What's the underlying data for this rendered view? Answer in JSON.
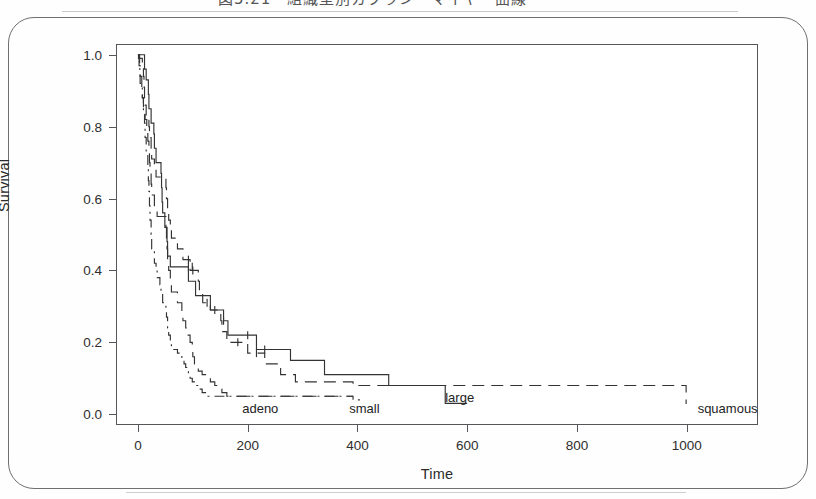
{
  "figure": {
    "caption": "図5.21　組織型別カプラン・マイヤー曲線",
    "border_color": "#6f6f6f",
    "background": "#ffffff"
  },
  "chart_data": {
    "type": "line",
    "title": "",
    "xlabel": "Time",
    "ylabel": "Survival",
    "xlim": [
      -40,
      1130
    ],
    "ylim": [
      -0.03,
      1.03
    ],
    "grid": false,
    "legend_position": "inline-annotations",
    "xticks": [
      0,
      200,
      400,
      600,
      800,
      1000
    ],
    "xtick_labels": [
      "0",
      "200",
      "400",
      "600",
      "800",
      "1000"
    ],
    "yticks": [
      0.0,
      0.2,
      0.4,
      0.6,
      0.8,
      1.0
    ],
    "ytick_labels": [
      "0.0",
      "0.2",
      "0.4",
      "0.6",
      "0.8",
      "1.0"
    ],
    "annotations": [
      {
        "text": "adeno",
        "x": 190,
        "y": 0.02
      },
      {
        "text": "small",
        "x": 385,
        "y": 0.02
      },
      {
        "text": "large",
        "x": 560,
        "y": 0.05
      },
      {
        "text": "squamous",
        "x": 1020,
        "y": 0.02
      }
    ],
    "series": [
      {
        "name": "squamous",
        "label": "squamous",
        "dash": "12,7",
        "color": "#333333",
        "points": [
          [
            0,
            1.0
          ],
          [
            1,
            0.99
          ],
          [
            8,
            0.97
          ],
          [
            10,
            0.94
          ],
          [
            11,
            0.91
          ],
          [
            12,
            0.88
          ],
          [
            13,
            0.86
          ],
          [
            15,
            0.83
          ],
          [
            20,
            0.8
          ],
          [
            21,
            0.77
          ],
          [
            24,
            0.74
          ],
          [
            25,
            0.71
          ],
          [
            30,
            0.69
          ],
          [
            33,
            0.66
          ],
          [
            51,
            0.63
          ],
          [
            52,
            0.6
          ],
          [
            54,
            0.57
          ],
          [
            56,
            0.54
          ],
          [
            59,
            0.51
          ],
          [
            61,
            0.49
          ],
          [
            72,
            0.46
          ],
          [
            82,
            0.43
          ],
          [
            92,
            0.43
          ],
          [
            95,
            0.4
          ],
          [
            100,
            0.4
          ],
          [
            110,
            0.37
          ],
          [
            112,
            0.34
          ],
          [
            117,
            0.34
          ],
          [
            118,
            0.31
          ],
          [
            126,
            0.31
          ],
          [
            132,
            0.29
          ],
          [
            140,
            0.29
          ],
          [
            151,
            0.26
          ],
          [
            153,
            0.23
          ],
          [
            162,
            0.2
          ],
          [
            182,
            0.2
          ],
          [
            200,
            0.17
          ],
          [
            216,
            0.17
          ],
          [
            231,
            0.14
          ],
          [
            250,
            0.14
          ],
          [
            260,
            0.11
          ],
          [
            278,
            0.11
          ],
          [
            283,
            0.11
          ],
          [
            287,
            0.09
          ],
          [
            314,
            0.09
          ],
          [
            340,
            0.09
          ],
          [
            384,
            0.09
          ],
          [
            389,
            0.09
          ],
          [
            392,
            0.08
          ],
          [
            553,
            0.08
          ],
          [
            991,
            0.08
          ],
          [
            999,
            0.03
          ],
          [
            1000,
            0.03
          ]
        ]
      },
      {
        "name": "large",
        "label": "large",
        "dash": "none",
        "color": "#333333",
        "points": [
          [
            0,
            1.0
          ],
          [
            12,
            0.96
          ],
          [
            15,
            0.93
          ],
          [
            19,
            0.89
          ],
          [
            20,
            0.85
          ],
          [
            24,
            0.81
          ],
          [
            29,
            0.78
          ],
          [
            30,
            0.74
          ],
          [
            33,
            0.7
          ],
          [
            42,
            0.67
          ],
          [
            43,
            0.63
          ],
          [
            44,
            0.59
          ],
          [
            45,
            0.56
          ],
          [
            49,
            0.52
          ],
          [
            53,
            0.48
          ],
          [
            54,
            0.44
          ],
          [
            57,
            0.44
          ],
          [
            59,
            0.41
          ],
          [
            63,
            0.41
          ],
          [
            80,
            0.41
          ],
          [
            84,
            0.41
          ],
          [
            87,
            0.41
          ],
          [
            92,
            0.37
          ],
          [
            99,
            0.37
          ],
          [
            103,
            0.37
          ],
          [
            105,
            0.33
          ],
          [
            111,
            0.33
          ],
          [
            112,
            0.33
          ],
          [
            116,
            0.33
          ],
          [
            132,
            0.29
          ],
          [
            133,
            0.29
          ],
          [
            140,
            0.29
          ],
          [
            156,
            0.26
          ],
          [
            162,
            0.26
          ],
          [
            164,
            0.22
          ],
          [
            177,
            0.22
          ],
          [
            186,
            0.22
          ],
          [
            200,
            0.22
          ],
          [
            216,
            0.18
          ],
          [
            231,
            0.18
          ],
          [
            250,
            0.18
          ],
          [
            260,
            0.18
          ],
          [
            278,
            0.15
          ],
          [
            283,
            0.15
          ],
          [
            287,
            0.15
          ],
          [
            314,
            0.15
          ],
          [
            340,
            0.11
          ],
          [
            378,
            0.11
          ],
          [
            384,
            0.11
          ],
          [
            392,
            0.11
          ],
          [
            411,
            0.11
          ],
          [
            457,
            0.08
          ],
          [
            467,
            0.08
          ],
          [
            553,
            0.08
          ],
          [
            560,
            0.03
          ],
          [
            600,
            0.03
          ]
        ]
      },
      {
        "name": "small",
        "label": "small",
        "dash": "14,8",
        "color": "#333333",
        "points": [
          [
            0,
            1.0
          ],
          [
            2,
            0.97
          ],
          [
            4,
            0.94
          ],
          [
            7,
            0.91
          ],
          [
            8,
            0.88
          ],
          [
            10,
            0.85
          ],
          [
            13,
            0.82
          ],
          [
            16,
            0.79
          ],
          [
            18,
            0.76
          ],
          [
            20,
            0.73
          ],
          [
            21,
            0.7
          ],
          [
            22,
            0.67
          ],
          [
            24,
            0.64
          ],
          [
            25,
            0.61
          ],
          [
            30,
            0.58
          ],
          [
            35,
            0.55
          ],
          [
            51,
            0.52
          ],
          [
            52,
            0.49
          ],
          [
            53,
            0.46
          ],
          [
            54,
            0.43
          ],
          [
            56,
            0.4
          ],
          [
            59,
            0.37
          ],
          [
            61,
            0.34
          ],
          [
            72,
            0.31
          ],
          [
            80,
            0.28
          ],
          [
            82,
            0.26
          ],
          [
            87,
            0.24
          ],
          [
            90,
            0.22
          ],
          [
            95,
            0.2
          ],
          [
            99,
            0.18
          ],
          [
            100,
            0.16
          ],
          [
            103,
            0.14
          ],
          [
            105,
            0.13
          ],
          [
            110,
            0.12
          ],
          [
            117,
            0.11
          ],
          [
            126,
            0.1
          ],
          [
            132,
            0.09
          ],
          [
            140,
            0.08
          ],
          [
            151,
            0.07
          ],
          [
            153,
            0.06
          ],
          [
            162,
            0.05
          ],
          [
            182,
            0.05
          ],
          [
            200,
            0.05
          ],
          [
            218,
            0.05
          ],
          [
            250,
            0.05
          ],
          [
            280,
            0.05
          ],
          [
            310,
            0.05
          ],
          [
            340,
            0.05
          ],
          [
            378,
            0.05
          ],
          [
            384,
            0.05
          ],
          [
            392,
            0.05
          ]
        ]
      },
      {
        "name": "adeno",
        "label": "adeno",
        "dash": "10,5,2,5",
        "color": "#333333",
        "points": [
          [
            0,
            1.0
          ],
          [
            3,
            0.96
          ],
          [
            4,
            0.92
          ],
          [
            8,
            0.88
          ],
          [
            10,
            0.84
          ],
          [
            12,
            0.81
          ],
          [
            13,
            0.77
          ],
          [
            15,
            0.73
          ],
          [
            18,
            0.69
          ],
          [
            19,
            0.65
          ],
          [
            20,
            0.62
          ],
          [
            21,
            0.58
          ],
          [
            22,
            0.54
          ],
          [
            24,
            0.5
          ],
          [
            25,
            0.46
          ],
          [
            30,
            0.42
          ],
          [
            33,
            0.4
          ],
          [
            35,
            0.38
          ],
          [
            40,
            0.36
          ],
          [
            42,
            0.34
          ],
          [
            45,
            0.31
          ],
          [
            51,
            0.29
          ],
          [
            52,
            0.27
          ],
          [
            54,
            0.24
          ],
          [
            56,
            0.22
          ],
          [
            59,
            0.2
          ],
          [
            61,
            0.18
          ],
          [
            72,
            0.17
          ],
          [
            80,
            0.15
          ],
          [
            84,
            0.14
          ],
          [
            87,
            0.13
          ],
          [
            90,
            0.12
          ],
          [
            92,
            0.11
          ],
          [
            95,
            0.1
          ],
          [
            99,
            0.09
          ],
          [
            103,
            0.08
          ],
          [
            110,
            0.07
          ],
          [
            117,
            0.06
          ],
          [
            126,
            0.05
          ],
          [
            132,
            0.05
          ],
          [
            140,
            0.05
          ],
          [
            151,
            0.05
          ],
          [
            162,
            0.05
          ],
          [
            186,
            0.05
          ],
          [
            200,
            0.05
          ],
          [
            231,
            0.05
          ],
          [
            260,
            0.05
          ],
          [
            278,
            0.05
          ],
          [
            283,
            0.05
          ],
          [
            287,
            0.05
          ],
          [
            300,
            0.05
          ],
          [
            314,
            0.05
          ],
          [
            340,
            0.05
          ],
          [
            378,
            0.05
          ],
          [
            384,
            0.05
          ],
          [
            392,
            0.04
          ],
          [
            411,
            0.04
          ]
        ]
      }
    ],
    "censor_marks": [
      {
        "series": "large",
        "x": 92,
        "y": 0.41
      },
      {
        "series": "large",
        "x": 99,
        "y": 0.41
      },
      {
        "series": "large",
        "x": 156,
        "y": 0.26
      },
      {
        "series": "large",
        "x": 200,
        "y": 0.22
      },
      {
        "series": "large",
        "x": 231,
        "y": 0.18
      },
      {
        "series": "squamous",
        "x": 92,
        "y": 0.43
      },
      {
        "series": "squamous",
        "x": 100,
        "y": 0.4
      },
      {
        "series": "squamous",
        "x": 126,
        "y": 0.31
      },
      {
        "series": "squamous",
        "x": 140,
        "y": 0.29
      },
      {
        "series": "squamous",
        "x": 182,
        "y": 0.2
      },
      {
        "series": "squamous",
        "x": 216,
        "y": 0.17
      }
    ]
  }
}
